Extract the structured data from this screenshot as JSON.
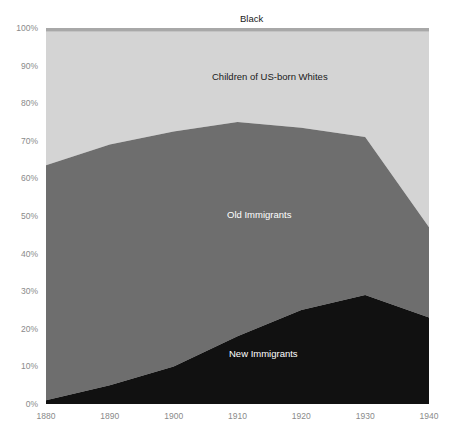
{
  "chart_data": {
    "type": "area",
    "title": "",
    "subtitle": "",
    "xlabel": "",
    "ylabel": "",
    "stacked": true,
    "normalized": true,
    "grid": false,
    "legend_position": "inline-annotations",
    "x": [
      1880,
      1890,
      1900,
      1910,
      1920,
      1930,
      1940
    ],
    "xtick_labels": [
      "1880",
      "1890",
      "1900",
      "1910",
      "1920",
      "1930",
      "1940"
    ],
    "xlim": [
      1880,
      1940
    ],
    "ylim": [
      0,
      100
    ],
    "ytick_labels": [
      "0%",
      "10%",
      "20%",
      "30%",
      "40%",
      "50%",
      "60%",
      "70%",
      "80%",
      "90%",
      "100%"
    ],
    "ytick_values": [
      0,
      10,
      20,
      30,
      40,
      50,
      60,
      70,
      80,
      90,
      100
    ],
    "series": [
      {
        "name": "New Immigrants",
        "color": "#111111",
        "label_color": "#ffffff",
        "values": [
          1,
          5,
          10,
          18,
          25,
          29,
          23
        ]
      },
      {
        "name": "Old Immigrants",
        "color": "#6e6e6e",
        "label_color": "#ffffff",
        "values": [
          62.5,
          64,
          62.5,
          57,
          48.5,
          42,
          24
        ]
      },
      {
        "name": "Children of US-born Whites",
        "color": "#d4d4d4",
        "label_color": "#1a1a1a",
        "values": [
          35.5,
          30,
          26.5,
          24,
          25.5,
          28,
          52
        ]
      },
      {
        "name": "Black",
        "color": "#a8a8a8",
        "label_color": "#1a1a1a",
        "values": [
          1,
          1,
          1,
          1,
          1,
          1,
          1
        ]
      }
    ],
    "cumulative_tops": {
      "new_immigrants": [
        1,
        5,
        10,
        18,
        25,
        29,
        23
      ],
      "old_immigrants": [
        63.5,
        69,
        72.5,
        75,
        73.5,
        71,
        47
      ],
      "children_of_us_born_whites": [
        99,
        99,
        99,
        99,
        99,
        99,
        99
      ],
      "black": [
        100,
        100,
        100,
        100,
        100,
        100,
        100
      ]
    },
    "annotations": [
      {
        "text": "Black",
        "x_pct": 50.5,
        "y_pct": 101.5
      },
      {
        "text": "Children of US-born Whites",
        "x_pct": 55,
        "y_pct": 87
      },
      {
        "text": "Old Immigrants",
        "x_pct": 57,
        "y_pct": 51
      },
      {
        "text": "New Immigrants",
        "x_pct": 60,
        "y_pct": 13
      }
    ]
  },
  "axis": {
    "y_ticks": [
      "100%",
      "90%",
      "80%",
      "70%",
      "60%",
      "50%",
      "40%",
      "30%",
      "20%",
      "10%",
      "0%"
    ],
    "x_ticks": [
      "1880",
      "1890",
      "1900",
      "1910",
      "1920",
      "1930",
      "1940"
    ]
  },
  "labels": {
    "black": "Black",
    "children_of_us_born_whites": "Children of US-born Whites",
    "old_immigrants": "Old Immigrants",
    "new_immigrants": "New Immigrants"
  },
  "colors": {
    "new_immigrants": "#111111",
    "old_immigrants": "#6e6e6e",
    "children_of_us_born_whites": "#d4d4d4",
    "black_band": "#a8a8a8",
    "axis_text": "#8a8a8a",
    "background": "#ffffff"
  }
}
